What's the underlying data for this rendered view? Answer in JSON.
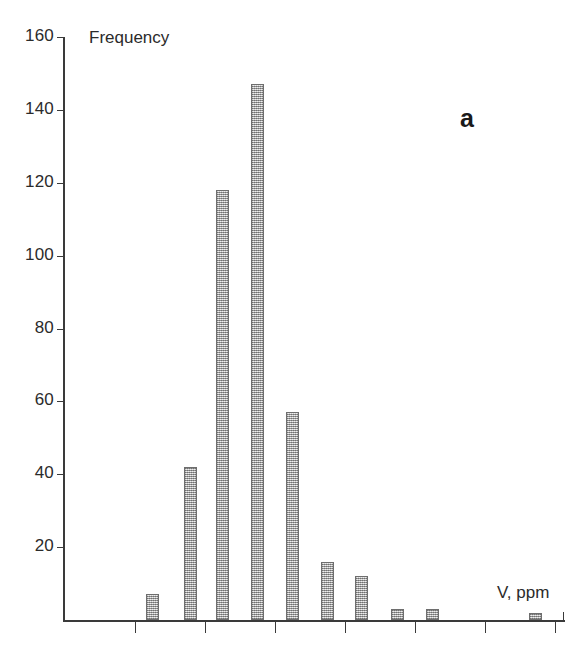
{
  "figure": {
    "panel_label": "a",
    "background_color": "#ffffff",
    "bar_fill_color": "#b9b9b9",
    "bar_edge_color": "#6e6e6e",
    "axis_color": "#3a3a3a"
  },
  "chart_data": {
    "type": "bar",
    "title": "",
    "subtitle": "",
    "xlabel": "V, ppm",
    "ylabel": "Frequency",
    "ylim": [
      0,
      160
    ],
    "y_ticks": [
      0,
      20,
      40,
      60,
      80,
      100,
      120,
      140,
      160
    ],
    "y_tick_labels": [
      "20",
      "40",
      "60",
      "80",
      "100",
      "120",
      "140",
      "160"
    ],
    "x_ticks_unlabeled": 7,
    "grid": false,
    "legend": null,
    "annotations": [
      "a"
    ],
    "categories": [
      "1",
      "2",
      "3",
      "4",
      "5",
      "6",
      "7",
      "8",
      "9",
      "10"
    ],
    "values": [
      7,
      42,
      118,
      147,
      57,
      16,
      12,
      3,
      3,
      2
    ],
    "bars": [
      {
        "index": 1,
        "value": 7,
        "x_px": 152,
        "width_px": 13
      },
      {
        "index": 2,
        "value": 42,
        "x_px": 190,
        "width_px": 13
      },
      {
        "index": 3,
        "value": 118,
        "x_px": 222,
        "width_px": 13
      },
      {
        "index": 4,
        "value": 147,
        "x_px": 257,
        "width_px": 13
      },
      {
        "index": 5,
        "value": 57,
        "x_px": 292,
        "width_px": 13
      },
      {
        "index": 6,
        "value": 16,
        "x_px": 327,
        "width_px": 13
      },
      {
        "index": 7,
        "value": 12,
        "x_px": 361,
        "width_px": 13
      },
      {
        "index": 8,
        "value": 3,
        "x_px": 397,
        "width_px": 13
      },
      {
        "index": 9,
        "value": 3,
        "x_px": 432,
        "width_px": 13
      },
      {
        "index": 10,
        "value": 2,
        "x_px": 535,
        "width_px": 13
      }
    ]
  }
}
